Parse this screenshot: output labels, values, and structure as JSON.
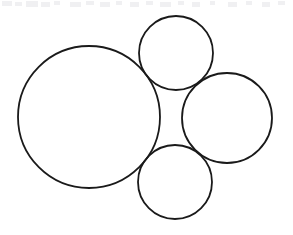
{
  "figure": {
    "canvas": {
      "width": 293,
      "height": 235,
      "background_color": "#ffffff"
    },
    "style": {
      "stroke_color": "#1a1a1a",
      "stroke_width": 1.8,
      "fill_color": "none",
      "artifact_color": "#f0f0f2"
    },
    "shapes": [
      {
        "name": "large-circle",
        "label": "Large circle (left)",
        "cx": 89,
        "cy": 117,
        "r": 71
      },
      {
        "name": "top-circle",
        "label": "Small circle (top)",
        "cx": 176,
        "cy": 53,
        "r": 37
      },
      {
        "name": "right-circle",
        "label": "Medium circle (right)",
        "cx": 227,
        "cy": 118,
        "r": 45
      },
      {
        "name": "bottom-circle",
        "label": "Small circle (bottom)",
        "cx": 175,
        "cy": 182,
        "r": 37
      }
    ],
    "artifacts": [
      {
        "x": 2,
        "y": 1,
        "w": 10,
        "h": 5
      },
      {
        "x": 15,
        "y": 2,
        "w": 7,
        "h": 4
      },
      {
        "x": 26,
        "y": 1,
        "w": 12,
        "h": 6
      },
      {
        "x": 41,
        "y": 2,
        "w": 9,
        "h": 5
      },
      {
        "x": 54,
        "y": 1,
        "w": 6,
        "h": 4
      },
      {
        "x": 70,
        "y": 2,
        "w": 11,
        "h": 5
      },
      {
        "x": 86,
        "y": 1,
        "w": 8,
        "h": 4
      },
      {
        "x": 100,
        "y": 2,
        "w": 10,
        "h": 5
      },
      {
        "x": 116,
        "y": 1,
        "w": 6,
        "h": 4
      },
      {
        "x": 130,
        "y": 2,
        "w": 9,
        "h": 5
      },
      {
        "x": 146,
        "y": 1,
        "w": 7,
        "h": 4
      },
      {
        "x": 160,
        "y": 2,
        "w": 11,
        "h": 5
      },
      {
        "x": 178,
        "y": 1,
        "w": 6,
        "h": 4
      },
      {
        "x": 192,
        "y": 2,
        "w": 8,
        "h": 5
      },
      {
        "x": 210,
        "y": 1,
        "w": 5,
        "h": 4
      },
      {
        "x": 228,
        "y": 2,
        "w": 9,
        "h": 5
      },
      {
        "x": 246,
        "y": 1,
        "w": 6,
        "h": 4
      },
      {
        "x": 262,
        "y": 2,
        "w": 8,
        "h": 5
      },
      {
        "x": 278,
        "y": 1,
        "w": 7,
        "h": 4
      }
    ]
  },
  "chart_data": {
    "type": "diagram",
    "units": "pixels",
    "circles": [
      {
        "id": "large",
        "cx": 89,
        "cy": 117,
        "r": 71,
        "diameter": 142
      },
      {
        "id": "top",
        "cx": 176,
        "cy": 53,
        "r": 37,
        "diameter": 74
      },
      {
        "id": "right",
        "cx": 227,
        "cy": 118,
        "r": 45,
        "diameter": 90
      },
      {
        "id": "bottom",
        "cx": 175,
        "cy": 182,
        "r": 37,
        "diameter": 74
      }
    ],
    "tangencies": [
      [
        "large",
        "top"
      ],
      [
        "large",
        "bottom"
      ],
      [
        "top",
        "right"
      ],
      [
        "right",
        "bottom"
      ]
    ],
    "legend": [],
    "xlabel": "",
    "ylabel": "",
    "grid": false
  }
}
